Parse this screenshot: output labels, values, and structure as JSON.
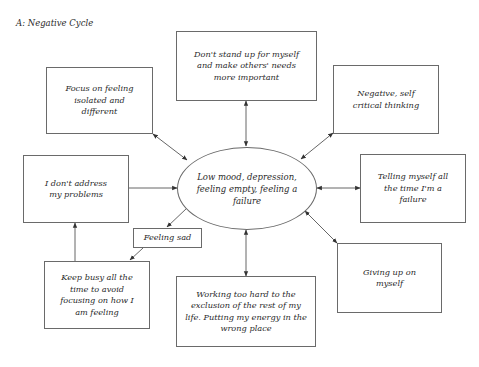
{
  "title": "A: Negative Cycle",
  "center": {
    "label": "Low mood, depression, feeling empty, feeling a failure"
  },
  "nodes": [
    {
      "id": "dont-stand-up",
      "label": "Don't stand up for myself and make others' needs more important"
    },
    {
      "id": "negative-thinking",
      "label": "Negative, self critical thinking"
    },
    {
      "id": "telling-myself",
      "label": "Telling myself all the time I'm a failure"
    },
    {
      "id": "giving-up",
      "label": "Giving up on myself"
    },
    {
      "id": "working-too-hard",
      "label": "Working too hard to the exclusion of the rest of my life. Putting my energy in the wrong place"
    },
    {
      "id": "feeling-sad",
      "label": "Feeling sad"
    },
    {
      "id": "keep-busy",
      "label": "Keep busy all the time to avoid focusing on how I am feeling"
    },
    {
      "id": "dont-address",
      "label": "I don't address my problems"
    },
    {
      "id": "focus-isolated",
      "label": "Focus on feeling isolated and different"
    }
  ],
  "edges": [
    {
      "from": "center",
      "to": "dont-stand-up",
      "type": "bidirectional"
    },
    {
      "from": "center",
      "to": "negative-thinking",
      "type": "bidirectional"
    },
    {
      "from": "center",
      "to": "telling-myself",
      "type": "bidirectional"
    },
    {
      "from": "center",
      "to": "giving-up",
      "type": "bidirectional"
    },
    {
      "from": "center",
      "to": "working-too-hard",
      "type": "bidirectional"
    },
    {
      "from": "center",
      "to": "focus-isolated",
      "type": "bidirectional"
    },
    {
      "from": "center",
      "to": "feeling-sad",
      "type": "directed"
    },
    {
      "from": "feeling-sad",
      "to": "keep-busy",
      "type": "directed"
    },
    {
      "from": "keep-busy",
      "to": "dont-address",
      "type": "directed"
    },
    {
      "from": "dont-address",
      "to": "center",
      "type": "directed"
    }
  ],
  "colors": {
    "line": "#555555",
    "border": "#6a6a6a",
    "text": "#2a2a2a"
  }
}
